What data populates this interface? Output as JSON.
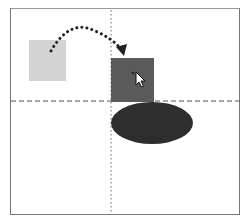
{
  "diagram": {
    "colors": {
      "frame": "#777777",
      "source_square": "#d3d3d3",
      "target_square": "#5a5a5a",
      "ellipse": "#2e2e2e",
      "guide": "#555555",
      "arrow": "#222222"
    },
    "elements": {
      "source_square": {
        "x": 29,
        "y": 40,
        "w": 37,
        "h": 40
      },
      "target_square": {
        "x": 111,
        "y": 58,
        "w": 43,
        "h": 44
      },
      "ellipse": {
        "cx": 152,
        "cy": 123,
        "rx": 41,
        "ry": 21
      },
      "horizontal_guide_y": 101,
      "vertical_guide_x": 111
    },
    "icons": [
      "cursor-arrow-icon",
      "dotted-arrow-icon"
    ]
  }
}
